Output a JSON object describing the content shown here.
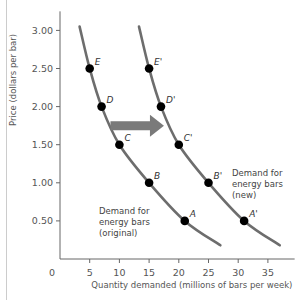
{
  "chart_data": {
    "type": "line",
    "title": "",
    "xlabel": "Quantity demanded (millions of bars per week)",
    "ylabel": "Price (dollars per bar)",
    "xlim": [
      0,
      40
    ],
    "ylim": [
      0,
      3.25
    ],
    "x_ticks": [
      0,
      5,
      10,
      15,
      20,
      25,
      30,
      35
    ],
    "x_tick_labels": [
      "0",
      "5",
      "10",
      "15",
      "20",
      "25",
      "30",
      "35"
    ],
    "y_ticks": [
      0.5,
      1.0,
      1.5,
      2.0,
      2.5,
      3.0
    ],
    "y_tick_labels": [
      "0.50",
      "1.00",
      "1.50",
      "2.00",
      "2.50",
      "3.00"
    ],
    "origin_label": "0",
    "grid": false,
    "legend": "none",
    "series": [
      {
        "name": "Demand for energy bars (original)",
        "label_lines": [
          "Demand for",
          "energy bars",
          "(original)"
        ],
        "color": "#6d6d6d",
        "curve_x": [
          3.3,
          5,
          7,
          10,
          15,
          21,
          27
        ],
        "curve_y": [
          3.05,
          2.5,
          2.0,
          1.5,
          1.0,
          0.5,
          0.18
        ],
        "points": [
          {
            "label": "A",
            "x": 21,
            "y": 0.5
          },
          {
            "label": "B",
            "x": 15,
            "y": 1.0
          },
          {
            "label": "C",
            "x": 10,
            "y": 1.5
          },
          {
            "label": "D",
            "x": 7,
            "y": 2.0
          },
          {
            "label": "E",
            "x": 5,
            "y": 2.5
          }
        ]
      },
      {
        "name": "Demand for energy bars (new)",
        "label_lines": [
          "Demand for",
          "energy bars",
          "(new)"
        ],
        "color": "#6d6d6d",
        "curve_x": [
          13.3,
          15,
          17,
          20,
          25,
          31,
          37
        ],
        "curve_y": [
          3.05,
          2.5,
          2.0,
          1.5,
          1.0,
          0.5,
          0.18
        ],
        "points": [
          {
            "label": "A'",
            "x": 31,
            "y": 0.5
          },
          {
            "label": "B'",
            "x": 25,
            "y": 1.0
          },
          {
            "label": "C'",
            "x": 20,
            "y": 1.5
          },
          {
            "label": "D'",
            "x": 17,
            "y": 2.0
          },
          {
            "label": "E'",
            "x": 15,
            "y": 2.5
          }
        ]
      }
    ],
    "annotations": [
      {
        "type": "arrow",
        "direction": "right",
        "from": [
          8.5,
          1.75
        ],
        "to": [
          17.5,
          1.75
        ],
        "color": "#7a7a7a",
        "meaning": "increase in demand"
      }
    ]
  }
}
